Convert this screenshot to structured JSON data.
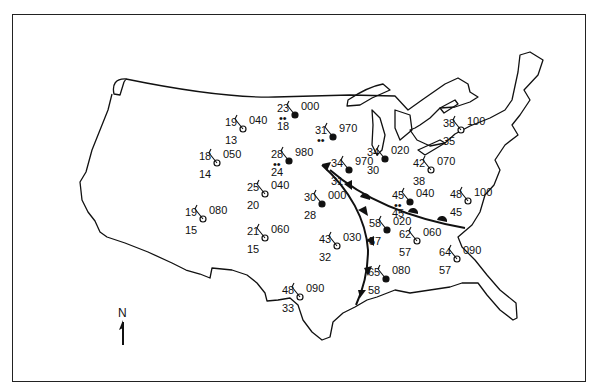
{
  "map": {
    "title": "",
    "region": "Contiguous United States",
    "north_arrow_label": "N",
    "colors": {
      "line": "#111111",
      "background": "#ffffff"
    },
    "fronts": [
      {
        "type": "cold",
        "description": "Cold front running from the Dakotas/Nebraska region south-southeast toward Texas/Louisiana coast"
      },
      {
        "type": "warm",
        "description": "Warm front extending east-southeast from the low toward the Carolinas"
      }
    ],
    "stations": [
      {
        "id": "s1",
        "x": 243,
        "y": 129,
        "temp": "19",
        "dew": "13",
        "pressure": "040",
        "sky": "clear",
        "weather": ""
      },
      {
        "id": "s2",
        "x": 295,
        "y": 115,
        "temp": "23",
        "dew": "18",
        "pressure": "000",
        "sky": "overcast",
        "weather": "••"
      },
      {
        "id": "s3",
        "x": 217,
        "y": 163,
        "temp": "18",
        "dew": "14",
        "pressure": "050",
        "sky": "clear",
        "weather": ""
      },
      {
        "id": "s4",
        "x": 289,
        "y": 161,
        "temp": "28",
        "dew": "24",
        "pressure": "980",
        "sky": "overcast",
        "weather": "••"
      },
      {
        "id": "s5",
        "x": 333,
        "y": 137,
        "temp": "31",
        "dew": "",
        "pressure": "970",
        "sky": "overcast",
        "weather": "••"
      },
      {
        "id": "s6",
        "x": 349,
        "y": 170,
        "temp": "34",
        "dew": "31",
        "pressure": "970",
        "sky": "overcast",
        "weather": ""
      },
      {
        "id": "s7",
        "x": 385,
        "y": 159,
        "temp": "34",
        "dew": "30",
        "pressure": "020",
        "sky": "overcast",
        "weather": ""
      },
      {
        "id": "s8",
        "x": 461,
        "y": 130,
        "temp": "38",
        "dew": "35",
        "pressure": "100",
        "sky": "clear",
        "weather": ""
      },
      {
        "id": "s9",
        "x": 431,
        "y": 170,
        "temp": "42",
        "dew": "38",
        "pressure": "070",
        "sky": "clear",
        "weather": ""
      },
      {
        "id": "s10",
        "x": 265,
        "y": 194,
        "temp": "25",
        "dew": "20",
        "pressure": "040",
        "sky": "clear",
        "weather": ""
      },
      {
        "id": "s11",
        "x": 322,
        "y": 204,
        "temp": "30",
        "dew": "28",
        "pressure": "000",
        "sky": "overcast",
        "weather": "showers"
      },
      {
        "id": "s12",
        "x": 410,
        "y": 202,
        "temp": "45",
        "dew": "45",
        "pressure": "040",
        "sky": "overcast",
        "weather": "••"
      },
      {
        "id": "s13",
        "x": 468,
        "y": 201,
        "temp": "48",
        "dew": "45",
        "pressure": "100",
        "sky": "clear",
        "weather": ""
      },
      {
        "id": "s14",
        "x": 203,
        "y": 219,
        "temp": "19",
        "dew": "15",
        "pressure": "080",
        "sky": "clear",
        "weather": ""
      },
      {
        "id": "s15",
        "x": 265,
        "y": 238,
        "temp": "21",
        "dew": "15",
        "pressure": "060",
        "sky": "clear",
        "weather": ""
      },
      {
        "id": "s16",
        "x": 337,
        "y": 246,
        "temp": "43",
        "dew": "32",
        "pressure": "030",
        "sky": "clear",
        "weather": ""
      },
      {
        "id": "s17",
        "x": 387,
        "y": 230,
        "temp": "58",
        "dew": "57",
        "pressure": "020",
        "sky": "overcast",
        "weather": "thunderstorm"
      },
      {
        "id": "s18",
        "x": 417,
        "y": 241,
        "temp": "62",
        "dew": "57",
        "pressure": "060",
        "sky": "clear",
        "weather": ""
      },
      {
        "id": "s19",
        "x": 457,
        "y": 259,
        "temp": "64",
        "dew": "57",
        "pressure": "090",
        "sky": "clear",
        "weather": ""
      },
      {
        "id": "s20",
        "x": 386,
        "y": 279,
        "temp": "65",
        "dew": "58",
        "pressure": "080",
        "sky": "overcast",
        "weather": ""
      },
      {
        "id": "s21",
        "x": 300,
        "y": 297,
        "temp": "48",
        "dew": "33",
        "pressure": "090",
        "sky": "clear",
        "weather": ""
      }
    ]
  }
}
